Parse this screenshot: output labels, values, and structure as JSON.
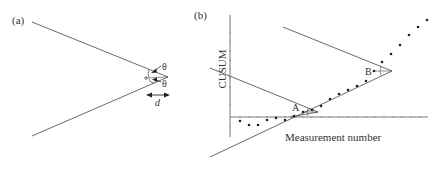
{
  "panel_a": {
    "label": "(a)",
    "theta_upper": "θ",
    "theta_lower": "θ",
    "distance_label": "d"
  },
  "panel_b": {
    "label": "(b)",
    "y_axis_label": "CUSUM",
    "x_axis_label": "Measurement number",
    "point_A_label": "A",
    "point_B_label": "B"
  },
  "colors": {
    "ink": "#333333",
    "background": "#ffffff"
  }
}
